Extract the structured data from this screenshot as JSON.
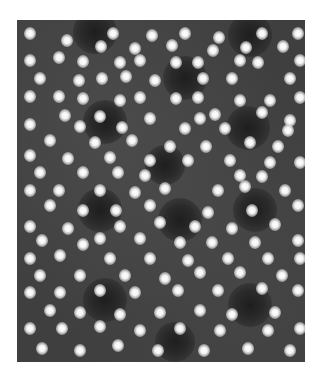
{
  "image": {
    "type": "grayscale micrograph",
    "description": "High-resolution lattice image: bright blurred atomic columns arranged in hexagonal rings around dark centers",
    "frame": {
      "x": 17,
      "y": 20,
      "width": 288,
      "height": 342
    },
    "colors": {
      "page_background": "#ffffff",
      "image_background": "#3f3f3f",
      "spot": "#ffffff",
      "hole": "#1e1e1e"
    },
    "holes": [
      {
        "x": 95,
        "y": 32,
        "r": 22
      },
      {
        "x": 250,
        "y": 35,
        "r": 22
      },
      {
        "x": 185,
        "y": 78,
        "r": 22
      },
      {
        "x": 105,
        "y": 122,
        "r": 22
      },
      {
        "x": 248,
        "y": 128,
        "r": 22
      },
      {
        "x": 165,
        "y": 165,
        "r": 20
      },
      {
        "x": 180,
        "y": 220,
        "r": 22
      },
      {
        "x": 100,
        "y": 210,
        "r": 22
      },
      {
        "x": 255,
        "y": 210,
        "r": 22
      },
      {
        "x": 105,
        "y": 300,
        "r": 22
      },
      {
        "x": 250,
        "y": 305,
        "r": 22
      },
      {
        "x": 175,
        "y": 342,
        "r": 20
      }
    ],
    "spots": [
      [
        30,
        33
      ],
      [
        67,
        40
      ],
      [
        113,
        33
      ],
      [
        152,
        35
      ],
      [
        185,
        33
      ],
      [
        219,
        37
      ],
      [
        262,
        33
      ],
      [
        283,
        46
      ],
      [
        101,
        46
      ],
      [
        135,
        48
      ],
      [
        172,
        45
      ],
      [
        213,
        50
      ],
      [
        246,
        47
      ],
      [
        298,
        33
      ],
      [
        30,
        60
      ],
      [
        59,
        57
      ],
      [
        83,
        61
      ],
      [
        120,
        62
      ],
      [
        140,
        60
      ],
      [
        176,
        62
      ],
      [
        198,
        62
      ],
      [
        240,
        60
      ],
      [
        258,
        62
      ],
      [
        300,
        60
      ],
      [
        40,
        78
      ],
      [
        79,
        80
      ],
      [
        102,
        78
      ],
      [
        126,
        76
      ],
      [
        155,
        80
      ],
      [
        203,
        78
      ],
      [
        232,
        78
      ],
      [
        290,
        78
      ],
      [
        30,
        96
      ],
      [
        59,
        96
      ],
      [
        83,
        98
      ],
      [
        120,
        100
      ],
      [
        140,
        97
      ],
      [
        176,
        98
      ],
      [
        198,
        97
      ],
      [
        240,
        100
      ],
      [
        270,
        100
      ],
      [
        300,
        97
      ],
      [
        65,
        115
      ],
      [
        100,
        116
      ],
      [
        150,
        118
      ],
      [
        215,
        114
      ],
      [
        262,
        112
      ],
      [
        290,
        120
      ],
      [
        30,
        124
      ],
      [
        80,
        126
      ],
      [
        122,
        127
      ],
      [
        185,
        128
      ],
      [
        200,
        118
      ],
      [
        225,
        128
      ],
      [
        288,
        130
      ],
      [
        50,
        140
      ],
      [
        95,
        142
      ],
      [
        132,
        140
      ],
      [
        170,
        146
      ],
      [
        206,
        146
      ],
      [
        250,
        142
      ],
      [
        278,
        146
      ],
      [
        30,
        155
      ],
      [
        68,
        158
      ],
      [
        110,
        157
      ],
      [
        150,
        160
      ],
      [
        188,
        160
      ],
      [
        230,
        160
      ],
      [
        270,
        162
      ],
      [
        300,
        162
      ],
      [
        40,
        172
      ],
      [
        83,
        172
      ],
      [
        118,
        172
      ],
      [
        145,
        175
      ],
      [
        240,
        175
      ],
      [
        262,
        176
      ],
      [
        30,
        190
      ],
      [
        59,
        190
      ],
      [
        100,
        190
      ],
      [
        135,
        192
      ],
      [
        165,
        188
      ],
      [
        218,
        190
      ],
      [
        245,
        186
      ],
      [
        285,
        190
      ],
      [
        50,
        205
      ],
      [
        83,
        210
      ],
      [
        116,
        210
      ],
      [
        150,
        205
      ],
      [
        208,
        212
      ],
      [
        252,
        210
      ],
      [
        298,
        205
      ],
      [
        30,
        226
      ],
      [
        68,
        228
      ],
      [
        120,
        226
      ],
      [
        160,
        222
      ],
      [
        195,
        226
      ],
      [
        232,
        228
      ],
      [
        275,
        224
      ],
      [
        42,
        240
      ],
      [
        83,
        244
      ],
      [
        100,
        238
      ],
      [
        140,
        238
      ],
      [
        180,
        242
      ],
      [
        212,
        242
      ],
      [
        255,
        242
      ],
      [
        298,
        240
      ],
      [
        30,
        258
      ],
      [
        60,
        255
      ],
      [
        110,
        258
      ],
      [
        150,
        258
      ],
      [
        188,
        260
      ],
      [
        228,
        258
      ],
      [
        268,
        258
      ],
      [
        300,
        258
      ],
      [
        40,
        275
      ],
      [
        80,
        275
      ],
      [
        125,
        275
      ],
      [
        165,
        278
      ],
      [
        200,
        272
      ],
      [
        240,
        272
      ],
      [
        282,
        275
      ],
      [
        30,
        292
      ],
      [
        60,
        292
      ],
      [
        100,
        290
      ],
      [
        135,
        292
      ],
      [
        178,
        290
      ],
      [
        218,
        290
      ],
      [
        262,
        288
      ],
      [
        298,
        290
      ],
      [
        50,
        310
      ],
      [
        80,
        312
      ],
      [
        120,
        314
      ],
      [
        160,
        312
      ],
      [
        200,
        310
      ],
      [
        232,
        314
      ],
      [
        275,
        312
      ],
      [
        30,
        328
      ],
      [
        62,
        328
      ],
      [
        100,
        326
      ],
      [
        140,
        330
      ],
      [
        180,
        328
      ],
      [
        220,
        330
      ],
      [
        268,
        330
      ],
      [
        300,
        328
      ],
      [
        42,
        348
      ],
      [
        80,
        350
      ],
      [
        118,
        345
      ],
      [
        158,
        350
      ],
      [
        204,
        350
      ],
      [
        248,
        348
      ],
      [
        290,
        350
      ]
    ]
  }
}
